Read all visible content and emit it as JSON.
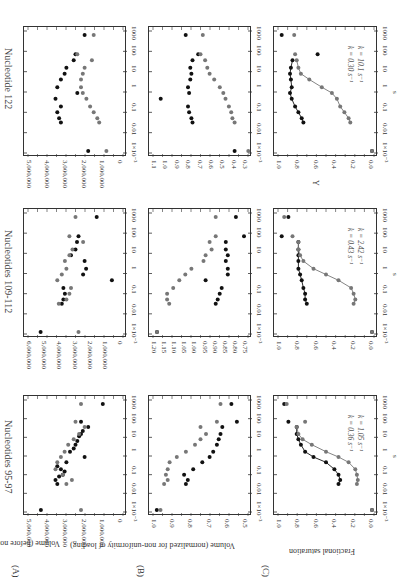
{
  "figure": {
    "orientation": "rotated 90deg (text reads top-to-bottom)",
    "row_labels": [
      "(A)",
      "(B)",
      "(C)"
    ],
    "column_titles": [
      "Nucleotides 95-97",
      "Nucleotides 109-112",
      "Nucleotide 122"
    ],
    "x_axis": {
      "label": "s",
      "ticks": [
        "1×10⁻³",
        "0.01",
        "0.1",
        "1",
        "10",
        "100",
        "1000"
      ]
    },
    "row_ylabels": {
      "A": "Volume (before normalization)",
      "B": "Volume (normalized for non-uniformity of loading)",
      "C_95_97": "Fractional saturation",
      "C_122": "Y"
    },
    "yticks": {
      "A_95_97": [
        "5,000,000",
        "4,000,000",
        "3,000,000",
        "2,000,000",
        "1,000,000",
        "0"
      ],
      "A_109_112": [
        "6,000,000",
        "5,000,000",
        "4,000,000",
        "3,000,000",
        "2,000,000",
        "1,000,000",
        "0"
      ],
      "A_122": [
        "5,000,000",
        "4,000,000",
        "3,000,000",
        "2,000,000",
        "1,000,000",
        "0"
      ],
      "B_95_97": [
        "1.0",
        "0.9",
        "0.8",
        "0.7",
        "0.6",
        "0.5"
      ],
      "B_109_112": [
        "1.20",
        "1.15",
        "1.10",
        "1.05",
        "1.00",
        "0.95",
        "0.90",
        "0.85",
        "0.80",
        "0.75"
      ],
      "B_122": [
        "1.1",
        "1.0",
        "0.9",
        "0.8",
        "0.7",
        "0.6",
        "0.5",
        "0.4",
        "0.3"
      ],
      "C": [
        "1.0",
        "0.8",
        "0.6",
        "0.4",
        "0.2",
        "0.0"
      ]
    },
    "annotations": {
      "k_95_97": [
        "k = 1.05 s⁻¹",
        "k = 0.36 s⁻¹"
      ],
      "k_109_112": [
        "k = 2.42 s⁻¹",
        "k = 0.43 s⁻¹"
      ],
      "k_122": [
        "k = 10.1 s⁻¹",
        "k = 0.30 s⁻¹"
      ]
    }
  },
  "chart_data": [
    {
      "type": "scatter",
      "panel": "A",
      "title": "Nucleotides 95-97",
      "xlabel": "s",
      "xscale": "log",
      "xlim": [
        0.001,
        1000
      ],
      "ylabel": "Volume (before normalization)",
      "ylim": [
        0,
        5000000
      ],
      "series": [
        {
          "name": "black",
          "x": [
            0.001,
            0.03,
            0.05,
            0.08,
            0.1,
            0.15,
            0.2,
            0.3,
            0.5,
            1,
            2,
            3,
            5,
            8,
            15,
            20,
            30,
            50,
            100,
            1000
          ],
          "y": [
            4400000,
            3500000,
            3600000,
            3400000,
            3200000,
            3100000,
            3300000,
            3500000,
            3000000,
            2000000,
            2800000,
            2600000,
            2500000,
            2400000,
            2300000,
            2200000,
            2100000,
            1800000,
            2200000,
            1000000
          ]
        },
        {
          "name": "gray",
          "x": [
            0.001,
            0.03,
            0.05,
            0.1,
            0.2,
            0.5,
            1,
            2,
            5,
            10,
            20,
            50,
            100,
            1000
          ],
          "y": [
            2200000,
            3000000,
            2700000,
            3200000,
            3600000,
            3500000,
            3300000,
            3100000,
            2900000,
            2600000,
            2300000,
            2000000,
            2500000,
            2200000
          ]
        }
      ]
    },
    {
      "type": "scatter",
      "panel": "B",
      "title": "Nucleotides 95-97",
      "xlabel": "s",
      "xscale": "log",
      "xlim": [
        0.001,
        1000
      ],
      "ylabel": "Volume (normalized for non-uniformity of loading)",
      "ylim": [
        0.5,
        1.0
      ],
      "series": [
        {
          "name": "black",
          "x": [
            0.001,
            0.03,
            0.05,
            0.1,
            0.2,
            0.5,
            1,
            2,
            5,
            10,
            20,
            50,
            100,
            1000
          ],
          "y": [
            0.99,
            0.83,
            0.82,
            0.84,
            0.79,
            0.74,
            0.7,
            0.68,
            0.66,
            0.65,
            0.64,
            0.63,
            0.55,
            0.58
          ]
        },
        {
          "name": "gray",
          "x": [
            0.001,
            0.03,
            0.05,
            0.1,
            0.2,
            0.5,
            1,
            2,
            5,
            10,
            20,
            50,
            100,
            1000
          ],
          "y": [
            0.97,
            0.95,
            0.93,
            0.94,
            0.93,
            0.92,
            0.88,
            0.83,
            0.78,
            0.75,
            0.72,
            0.75,
            0.66,
            0.64
          ]
        }
      ]
    },
    {
      "type": "scatter",
      "panel": "C",
      "title": "Nucleotides 95-97",
      "xlabel": "s",
      "xscale": "log",
      "xlim": [
        0.001,
        1000
      ],
      "ylabel": "Fractional saturation",
      "ylim": [
        0.0,
        1.1
      ],
      "series": [
        {
          "name": "black (k = 1.05 s-1)",
          "x": [
            0.001,
            0.03,
            0.05,
            0.1,
            0.2,
            0.5,
            1,
            2,
            5,
            10,
            20,
            50,
            100,
            1000
          ],
          "y": [
            0.0,
            0.4,
            0.38,
            0.4,
            0.45,
            0.55,
            0.7,
            0.8,
            0.85,
            0.88,
            0.9,
            0.9,
            1.0,
            1.05
          ]
        },
        {
          "name": "gray (k = 0.36 s-1)",
          "x": [
            0.001,
            0.03,
            0.05,
            0.1,
            0.2,
            0.5,
            1,
            2,
            5,
            10,
            20,
            50,
            100,
            1000
          ],
          "y": [
            0.0,
            0.18,
            0.17,
            0.18,
            0.2,
            0.28,
            0.4,
            0.55,
            0.72,
            0.83,
            0.88,
            0.9,
            0.8,
            1.02
          ]
        }
      ]
    },
    {
      "type": "scatter",
      "panel": "A",
      "title": "Nucleotides 109-112",
      "xlabel": "s",
      "xscale": "log",
      "xlim": [
        0.001,
        1000
      ],
      "ylabel": "Volume (before normalization)",
      "ylim": [
        0,
        6000000
      ],
      "series": [
        {
          "name": "black",
          "x": [
            0.001,
            0.03,
            0.05,
            0.1,
            0.2,
            0.5,
            1,
            2,
            5,
            10,
            20,
            50,
            100,
            1000
          ],
          "y": [
            5300000,
            3900000,
            3800000,
            3700000,
            3800000,
            600000,
            2500000,
            2300000,
            2400000,
            3300000,
            3000000,
            2900000,
            2800000,
            1600000
          ]
        },
        {
          "name": "gray",
          "x": [
            0.001,
            0.03,
            0.05,
            0.1,
            0.2,
            0.5,
            1,
            2,
            5,
            10,
            20,
            50,
            100,
            1000
          ],
          "y": [
            2800000,
            4100000,
            3600000,
            3400000,
            3300000,
            4200000,
            3900000,
            3600000,
            3700000,
            3400000,
            3200000,
            2500000,
            3400000,
            3000000
          ]
        }
      ]
    },
    {
      "type": "scatter",
      "panel": "B",
      "title": "Nucleotides 109-112",
      "xlabel": "s",
      "xscale": "log",
      "xlim": [
        0.001,
        1000
      ],
      "ylabel": "Volume (normalized for non-uniformity of loading)",
      "ylim": [
        0.75,
        1.2
      ],
      "series": [
        {
          "name": "black",
          "x": [
            0.001,
            0.03,
            0.05,
            0.1,
            0.2,
            0.5,
            1,
            2,
            5,
            10,
            20,
            50,
            100,
            1000
          ],
          "y": [
            1.19,
            0.9,
            0.89,
            0.88,
            0.87,
            0.95,
            0.84,
            0.84,
            0.85,
            0.84,
            0.85,
            0.85,
            0.76,
            0.8
          ]
        },
        {
          "name": "gray",
          "x": [
            0.001,
            0.03,
            0.05,
            0.1,
            0.2,
            0.5,
            1,
            2,
            5,
            10,
            20,
            50,
            100,
            1000
          ],
          "y": [
            1.19,
            1.13,
            1.14,
            1.14,
            1.11,
            1.08,
            1.05,
            1.02,
            0.96,
            0.95,
            0.92,
            0.93,
            0.9,
            0.9
          ]
        }
      ]
    },
    {
      "type": "scatter",
      "panel": "C",
      "title": "Nucleotides 109-112",
      "xlabel": "s",
      "xscale": "log",
      "xlim": [
        0.001,
        1000
      ],
      "ylabel": "Fractional saturation",
      "ylim": [
        0.0,
        1.1
      ],
      "series": [
        {
          "name": "black (k = 2.42 s-1)",
          "x": [
            0.001,
            0.03,
            0.05,
            0.1,
            0.2,
            0.5,
            1,
            2,
            5,
            10,
            20,
            50,
            100,
            1000
          ],
          "y": [
            0.0,
            0.78,
            0.8,
            0.8,
            0.82,
            0.84,
            0.86,
            0.88,
            0.88,
            0.88,
            0.88,
            0.88,
            1.08,
            1.0
          ]
        },
        {
          "name": "gray (k = 0.43 s-1)",
          "x": [
            0.001,
            0.03,
            0.05,
            0.1,
            0.2,
            0.5,
            1,
            2,
            5,
            10,
            20,
            50,
            100,
            1000
          ],
          "y": [
            0.0,
            0.22,
            0.2,
            0.22,
            0.25,
            0.4,
            0.55,
            0.7,
            0.82,
            0.86,
            0.88,
            0.88,
            0.95,
            1.05
          ]
        }
      ]
    },
    {
      "type": "scatter",
      "panel": "A",
      "title": "Nucleotide 122",
      "xlabel": "s",
      "xscale": "log",
      "xlim": [
        0.001,
        1000
      ],
      "ylabel": "Volume (before normalization)",
      "ylim": [
        0,
        5000000
      ],
      "series": [
        {
          "name": "black",
          "x": [
            0.001,
            0.03,
            0.05,
            0.1,
            0.2,
            0.5,
            1,
            2,
            5,
            10,
            20,
            50,
            100,
            1000
          ],
          "y": [
            1800000,
            3300000,
            3400000,
            3500000,
            3300000,
            3600000,
            2400000,
            3500000,
            3300000,
            3100000,
            3000000,
            2600000,
            2500000,
            2000000
          ]
        },
        {
          "name": "gray",
          "x": [
            0.001,
            0.03,
            0.05,
            0.1,
            0.2,
            0.5,
            1,
            2,
            5,
            10,
            20,
            50,
            100,
            1000
          ],
          "y": [
            800000,
            1200000,
            1300000,
            1500000,
            1700000,
            1900000,
            2100000,
            2200000,
            2200000,
            2100000,
            2000000,
            1600000,
            2400000,
            1500000
          ]
        }
      ]
    },
    {
      "type": "scatter",
      "panel": "B",
      "title": "Nucleotide 122",
      "xlabel": "s",
      "xscale": "log",
      "xlim": [
        0.001,
        1000
      ],
      "ylabel": "",
      "ylim": [
        0.3,
        1.1
      ],
      "series": [
        {
          "name": "black",
          "x": [
            0.001,
            0.03,
            0.05,
            0.1,
            0.2,
            0.5,
            1,
            2,
            5,
            10,
            20,
            50,
            100,
            1000
          ],
          "y": [
            0.4,
            0.77,
            0.78,
            0.8,
            0.81,
            1.05,
            0.8,
            0.81,
            0.79,
            0.78,
            0.79,
            0.77,
            0.72,
            0.83
          ]
        },
        {
          "name": "gray",
          "x": [
            0.001,
            0.03,
            0.05,
            0.1,
            0.2,
            0.5,
            1,
            2,
            5,
            10,
            20,
            50,
            100,
            1000
          ],
          "y": [
            0.28,
            0.4,
            0.42,
            0.43,
            0.45,
            0.48,
            0.5,
            0.53,
            0.58,
            0.62,
            0.64,
            0.66,
            0.7,
            0.68
          ]
        }
      ]
    },
    {
      "type": "scatter",
      "panel": "C",
      "title": "Nucleotide 122",
      "xlabel": "s",
      "xscale": "log",
      "xlim": [
        0.001,
        1000
      ],
      "ylabel": "Y",
      "ylim": [
        0.0,
        1.1
      ],
      "series": [
        {
          "name": "black (k = 10.1 s-1)",
          "x": [
            0.001,
            0.03,
            0.05,
            0.1,
            0.2,
            0.5,
            1,
            2,
            5,
            10,
            20,
            50,
            100,
            1000
          ],
          "y": [
            0.0,
            0.82,
            0.84,
            0.88,
            0.92,
            0.96,
            0.98,
            0.96,
            0.97,
            0.98,
            0.97,
            0.95,
            0.65,
            1.08
          ]
        },
        {
          "name": "gray (k = 0.30 s-1)",
          "x": [
            0.001,
            0.03,
            0.05,
            0.1,
            0.2,
            0.5,
            1,
            2,
            5,
            10,
            20,
            50,
            100,
            1000
          ],
          "y": [
            0.0,
            0.26,
            0.28,
            0.33,
            0.38,
            0.42,
            0.48,
            0.6,
            0.75,
            0.85,
            0.88,
            0.9,
            0.92,
            0.93
          ]
        }
      ]
    }
  ]
}
